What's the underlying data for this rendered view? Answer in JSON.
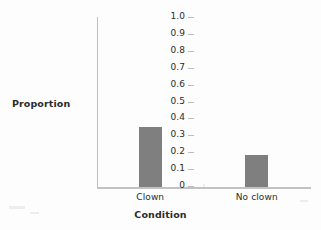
{
  "chart_data": {
    "type": "bar",
    "title": "",
    "xlabel": "Condition",
    "ylabel": "Proportion",
    "categories": [
      "Clown",
      "No clown"
    ],
    "values": [
      0.355,
      0.19
    ],
    "ylim": [
      0,
      1.0
    ],
    "ytick_labels": [
      "1.0",
      "0.9",
      "0.8",
      "0.7",
      "0.6",
      "0.5",
      "0.4",
      "0.3",
      "0.2",
      "0.1",
      "0"
    ],
    "ytick_values": [
      1.0,
      0.9,
      0.8,
      0.7,
      0.6,
      0.5,
      0.4,
      0.3,
      0.2,
      0.1,
      0
    ],
    "grid": false,
    "legend": false,
    "bar_color": "#807f80",
    "axis_color": "#bdbdbd",
    "text_color": "#2b2b2b",
    "background_color": "#fdfdfd"
  }
}
